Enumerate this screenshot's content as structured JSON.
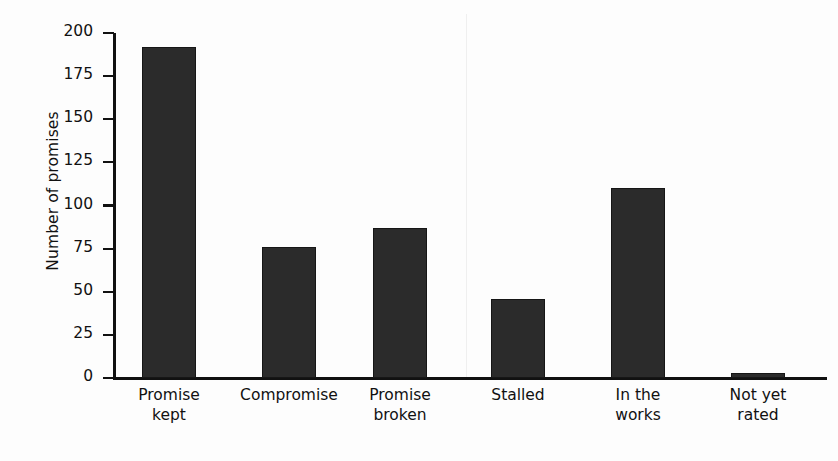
{
  "chart_data": {
    "type": "bar",
    "title": "",
    "subtitle": "",
    "xlabel": "",
    "ylabel": "Number of promises",
    "categories": [
      "Promise kept",
      "Compromise",
      "Promise broken",
      "Stalled",
      "In the works",
      "Not yet rated"
    ],
    "category_lines": [
      [
        "Promise",
        "kept"
      ],
      [
        "Compromise"
      ],
      [
        "Promise",
        "broken"
      ],
      [
        "Stalled"
      ],
      [
        "In the",
        "works"
      ],
      [
        "Not yet",
        "rated"
      ]
    ],
    "values": [
      192,
      76,
      87,
      46,
      110,
      3
    ],
    "ylim": [
      0,
      200
    ],
    "yticks": [
      0,
      25,
      50,
      75,
      100,
      125,
      150,
      175,
      200
    ],
    "ytick_labels": [
      "0",
      "25",
      "50",
      "75",
      "100",
      "125",
      "150",
      "175",
      "200"
    ],
    "grid": false,
    "legend": null,
    "legend_position": "none",
    "annotations": [],
    "colors": {
      "background": "#fdfdfd",
      "bar_fill": "#2b2b2b",
      "bar_edge": "#161616",
      "axis": "#111111",
      "text": "#111111"
    }
  }
}
